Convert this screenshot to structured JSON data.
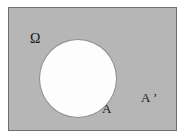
{
  "diagram": {
    "type": "venn-diagram",
    "background_color": "#ffffff",
    "universe": {
      "name": "universal-set",
      "label": "Ω",
      "label_plain": "Omega",
      "shape": "rectangle",
      "fill_color": "#b6b6b6",
      "border_color": "#6e6e6e",
      "region_meaning": "universal set"
    },
    "subset": {
      "name": "set-a",
      "label": "A",
      "shape": "circle",
      "fill_color": "#fdfdfd",
      "border_color": "#8d8d8d",
      "region_meaning": "set A"
    },
    "complement": {
      "name": "set-a-complement",
      "label": "A ’",
      "label_plain": "A'",
      "shape": "shaded-region",
      "fill_color": "#b6b6b6",
      "region_meaning": "complement of A"
    },
    "text_color": "#1a1a1a"
  }
}
